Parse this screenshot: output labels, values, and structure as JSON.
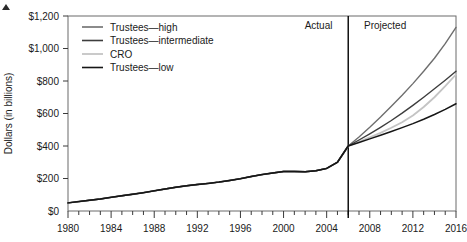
{
  "chart_data": {
    "type": "line",
    "title": "",
    "xlabel": "",
    "ylabel": "Dollars (in billions)",
    "xlim": [
      1980,
      2016
    ],
    "ylim": [
      0,
      1200
    ],
    "grid": false,
    "legend_position": "top-left",
    "y_ticks": [
      0,
      200,
      400,
      600,
      800,
      1000,
      1200
    ],
    "y_tick_labels": [
      "$0",
      "$200",
      "$400",
      "$600",
      "$800",
      "$1,000",
      "$1,200"
    ],
    "x_ticks": [
      1980,
      1984,
      1988,
      1992,
      1996,
      2000,
      2004,
      2008,
      2012,
      2016
    ],
    "x_tick_labels": [
      "1980",
      "1984",
      "1988",
      "1992",
      "1996",
      "2000",
      "2004",
      "2008",
      "2012",
      "2016"
    ],
    "x_minor_step": 1,
    "divider_x": 2006,
    "region_labels": [
      {
        "text": "Actual",
        "x": 2005,
        "align": "end"
      },
      {
        "text": "Projected",
        "x": 2007,
        "align": "start"
      }
    ],
    "x": [
      1980,
      1981,
      1982,
      1983,
      1984,
      1985,
      1986,
      1987,
      1988,
      1989,
      1990,
      1991,
      1992,
      1993,
      1994,
      1995,
      1996,
      1997,
      1998,
      1999,
      2000,
      2001,
      2002,
      2003,
      2004,
      2005,
      2006,
      2007,
      2008,
      2009,
      2010,
      2011,
      2012,
      2013,
      2014,
      2015,
      2016
    ],
    "series": [
      {
        "name": "Trustees—high",
        "color": "#6e6e6e",
        "width": 1.4,
        "values": [
          50,
          58,
          66,
          74,
          84,
          94,
          103,
          113,
          124,
          135,
          146,
          155,
          163,
          170,
          178,
          188,
          199,
          212,
          224,
          234,
          243,
          243,
          242,
          248,
          262,
          300,
          400,
          455,
          515,
          578,
          644,
          712,
          784,
          860,
          940,
          1030,
          1130
        ]
      },
      {
        "name": "Trustees—intermediate",
        "color": "#3d3d3d",
        "width": 1.4,
        "values": [
          50,
          58,
          66,
          74,
          84,
          94,
          103,
          113,
          124,
          135,
          146,
          155,
          163,
          170,
          178,
          188,
          199,
          212,
          224,
          234,
          243,
          243,
          242,
          248,
          262,
          300,
          400,
          437,
          475,
          515,
          557,
          602,
          650,
          700,
          752,
          805,
          860
        ]
      },
      {
        "name": "CRO",
        "color": "#c4c4c4",
        "width": 1.8,
        "values": [
          50,
          58,
          66,
          74,
          84,
          94,
          103,
          113,
          124,
          135,
          146,
          155,
          163,
          170,
          178,
          188,
          199,
          212,
          224,
          234,
          243,
          243,
          242,
          248,
          262,
          300,
          400,
          426,
          453,
          481,
          512,
          546,
          588,
          640,
          700,
          768,
          840
        ]
      },
      {
        "name": "Trustees—low",
        "color": "#161616",
        "width": 1.5,
        "values": [
          50,
          58,
          66,
          74,
          84,
          94,
          103,
          113,
          124,
          135,
          146,
          155,
          163,
          170,
          178,
          188,
          199,
          212,
          224,
          234,
          243,
          243,
          242,
          248,
          262,
          300,
          400,
          422,
          444,
          466,
          489,
          513,
          538,
          565,
          594,
          625,
          660
        ]
      }
    ]
  }
}
